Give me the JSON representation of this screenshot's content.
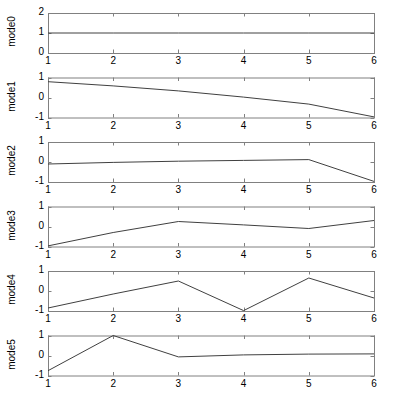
{
  "figure": {
    "width": 394,
    "height": 402,
    "background": "#ffffff",
    "axis_color": "#808080",
    "line_color": "#404040"
  },
  "chart_data": [
    {
      "type": "line",
      "title": "",
      "xlabel": "",
      "ylabel": "mode0",
      "x": [
        1,
        2,
        3,
        4,
        5,
        6
      ],
      "values": [
        1,
        1,
        1,
        1,
        1,
        1
      ],
      "xlim": [
        1,
        6
      ],
      "ylim": [
        0,
        2
      ],
      "xticks": [
        1,
        2,
        3,
        4,
        5,
        6
      ],
      "xticklabels": [
        "1",
        "2",
        "3",
        "4",
        "5",
        "6"
      ],
      "yticks": [
        0,
        1,
        2
      ],
      "yticklabels": [
        "0",
        "1",
        "2"
      ],
      "grid": false,
      "legend": null
    },
    {
      "type": "line",
      "title": "",
      "xlabel": "",
      "ylabel": "mode1",
      "x": [
        1,
        2,
        3,
        4,
        5,
        6
      ],
      "values": [
        0.79,
        0.58,
        0.33,
        0.02,
        -0.33,
        -0.97
      ],
      "xlim": [
        1,
        6
      ],
      "ylim": [
        -1,
        1
      ],
      "xticks": [
        1,
        2,
        3,
        4,
        5,
        6
      ],
      "xticklabels": [
        "1",
        "2",
        "3",
        "4",
        "5",
        "6"
      ],
      "yticks": [
        -1,
        0,
        1
      ],
      "yticklabels": [
        "-1",
        "0",
        "1"
      ],
      "grid": false,
      "legend": null
    },
    {
      "type": "line",
      "title": "",
      "xlabel": "",
      "ylabel": "mode2",
      "x": [
        1,
        2,
        3,
        4,
        5,
        6
      ],
      "values": [
        -0.1,
        -0.02,
        0.04,
        0.08,
        0.12,
        -0.97
      ],
      "xlim": [
        1,
        6
      ],
      "ylim": [
        -1,
        1
      ],
      "xticks": [
        1,
        2,
        3,
        4,
        5,
        6
      ],
      "xticklabels": [
        "1",
        "2",
        "3",
        "4",
        "5",
        "6"
      ],
      "yticks": [
        -1,
        0,
        1
      ],
      "yticklabels": [
        "-1",
        "0",
        "1"
      ],
      "grid": false,
      "legend": null
    },
    {
      "type": "line",
      "title": "",
      "xlabel": "",
      "ylabel": "mode3",
      "x": [
        1,
        2,
        3,
        4,
        5,
        6
      ],
      "values": [
        -0.97,
        -0.3,
        0.25,
        0.08,
        -0.1,
        0.3
      ],
      "xlim": [
        1,
        6
      ],
      "ylim": [
        -1,
        1
      ],
      "xticks": [
        1,
        2,
        3,
        4,
        5,
        6
      ],
      "xticklabels": [
        "1",
        "2",
        "3",
        "4",
        "5",
        "6"
      ],
      "yticks": [
        -1,
        0,
        1
      ],
      "yticklabels": [
        "-1",
        "0",
        "1"
      ],
      "grid": false,
      "legend": null
    },
    {
      "type": "line",
      "title": "",
      "xlabel": "",
      "ylabel": "mode4",
      "x": [
        1,
        2,
        3,
        4,
        5,
        6
      ],
      "values": [
        -0.85,
        -0.15,
        0.5,
        -0.98,
        0.65,
        -0.35
      ],
      "xlim": [
        1,
        6
      ],
      "ylim": [
        -1,
        1
      ],
      "xticks": [
        1,
        2,
        3,
        4,
        5,
        6
      ],
      "xticklabels": [
        "1",
        "2",
        "3",
        "4",
        "5",
        "6"
      ],
      "yticks": [
        -1,
        0,
        1
      ],
      "yticklabels": [
        "-1",
        "0",
        "1"
      ],
      "grid": false,
      "legend": null
    },
    {
      "type": "line",
      "title": "",
      "xlabel": "",
      "ylabel": "mode5",
      "x": [
        1,
        2,
        3,
        4,
        5,
        6
      ],
      "values": [
        -0.76,
        1.0,
        -0.07,
        0.03,
        0.07,
        0.08
      ],
      "xlim": [
        1,
        6
      ],
      "ylim": [
        -1,
        1
      ],
      "xticks": [
        1,
        2,
        3,
        4,
        5,
        6
      ],
      "xticklabels": [
        "1",
        "2",
        "3",
        "4",
        "5",
        "6"
      ],
      "yticks": [
        -1,
        0,
        1
      ],
      "yticklabels": [
        "-1",
        "0",
        "1"
      ],
      "grid": false,
      "legend": null
    }
  ]
}
